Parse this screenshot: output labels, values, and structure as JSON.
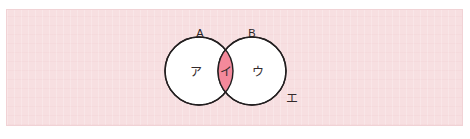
{
  "figure": {
    "type": "venn-diagram",
    "panel_background": "#f7dfe1",
    "panel_border": "#f1d2d5",
    "page_background": "#ffffff",
    "circle_stroke": "#231f20",
    "circle_fill": "#ffffff",
    "intersection_fill": "#f4899b"
  },
  "sets": {
    "left": {
      "name": "A",
      "cx": 199,
      "cy": 71,
      "r": 34
    },
    "right": {
      "name": "B",
      "cx": 252,
      "cy": 71,
      "r": 34
    }
  },
  "regions": [
    {
      "id": "a-only",
      "label": "ア",
      "x": 196,
      "y": 76,
      "shaded": false
    },
    {
      "id": "a-and-b",
      "label": "イ",
      "x": 226,
      "y": 76,
      "shaded": true
    },
    {
      "id": "b-only",
      "label": "ウ",
      "x": 258,
      "y": 76,
      "shaded": false
    },
    {
      "id": "outside",
      "label": "エ",
      "x": 292,
      "y": 103,
      "shaded": false
    }
  ],
  "set_labels": [
    {
      "id": "label-a",
      "text": "A",
      "x": 200,
      "y": 37
    },
    {
      "id": "label-b",
      "text": "B",
      "x": 252,
      "y": 37
    }
  ]
}
